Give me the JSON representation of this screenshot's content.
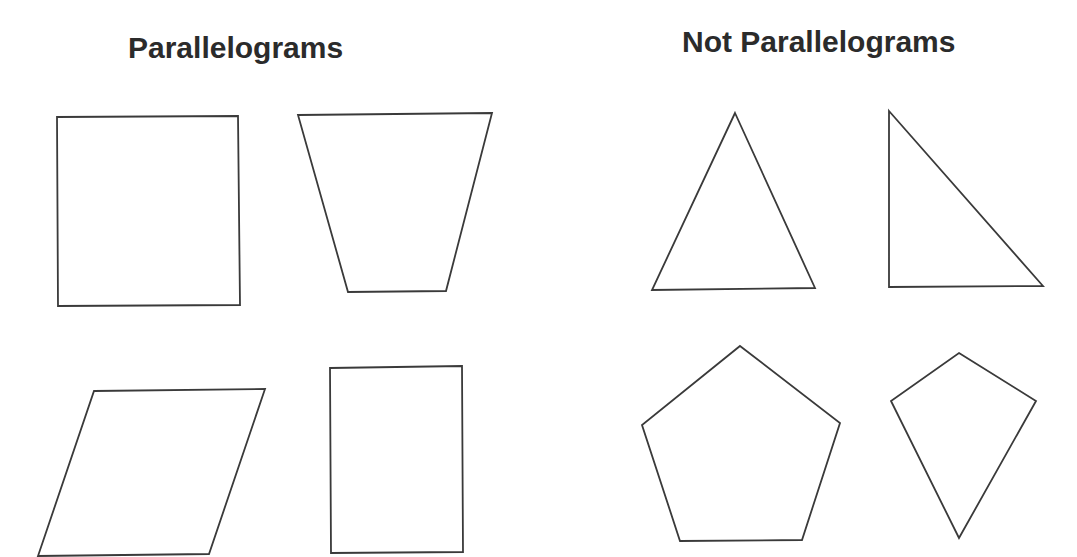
{
  "headings": {
    "left": "Parallelograms",
    "right": "Not Parallelograms"
  },
  "colors": {
    "background": "#ffffff",
    "stroke": "#3a3a3a",
    "text": "#2b2b2b"
  },
  "groups": [
    {
      "label": "Parallelograms",
      "shapes": [
        {
          "name": "square",
          "points": "57,117 238,116 240,305 58,306"
        },
        {
          "name": "trapezoid",
          "points": "298,115 492,113 446,291 348,292"
        },
        {
          "name": "slanted-parallelogram",
          "points": "94,391 265,389 209,554 38,556"
        },
        {
          "name": "rectangle",
          "points": "330,368 462,366 463,552 331,553"
        }
      ]
    },
    {
      "label": "Not Parallelograms",
      "shapes": [
        {
          "name": "acute-triangle",
          "points": "735,113 815,288 652,290"
        },
        {
          "name": "right-triangle",
          "points": "889,111 1043,286 889,287"
        },
        {
          "name": "pentagon",
          "points": "740,346 840,423 802,540 680,541 642,425"
        },
        {
          "name": "kite",
          "points": "959,353 1036,401 959,538 891,401"
        }
      ]
    }
  ]
}
